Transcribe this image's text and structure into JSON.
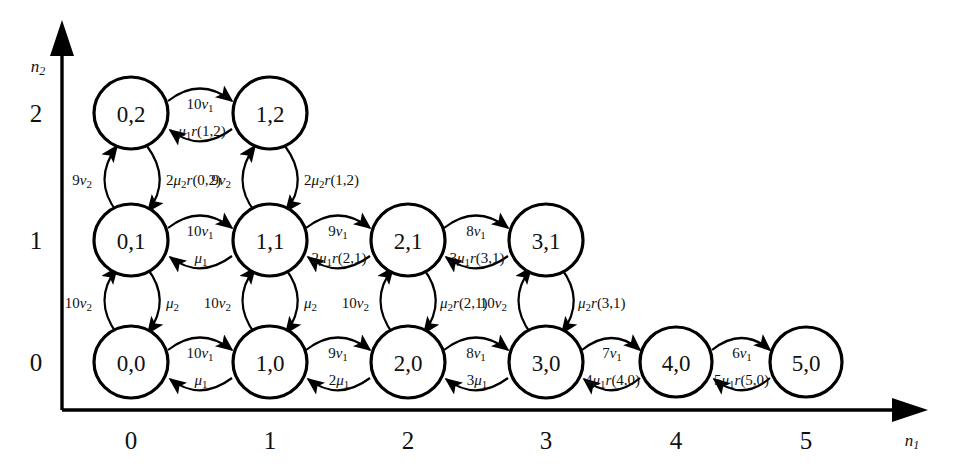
{
  "figure": {
    "type": "state-transition-diagram",
    "title": "",
    "axes": {
      "x": {
        "name": "n1",
        "name_sub": "1",
        "ticks": [
          "0",
          "1",
          "2",
          "3",
          "4",
          "5"
        ]
      },
      "y": {
        "name": "n2",
        "name_sub": "2",
        "ticks": [
          "0",
          "1",
          "2"
        ]
      }
    },
    "nodes": [
      {
        "id": "0,0",
        "label": "0,0",
        "x": 0,
        "y": 0
      },
      {
        "id": "1,0",
        "label": "1,0",
        "x": 1,
        "y": 0
      },
      {
        "id": "2,0",
        "label": "2,0",
        "x": 2,
        "y": 0
      },
      {
        "id": "3,0",
        "label": "3,0",
        "x": 3,
        "y": 0
      },
      {
        "id": "4,0",
        "label": "4,0",
        "x": 4,
        "y": 0
      },
      {
        "id": "5,0",
        "label": "5,0",
        "x": 5,
        "y": 0
      },
      {
        "id": "0,1",
        "label": "0,1",
        "x": 0,
        "y": 1
      },
      {
        "id": "1,1",
        "label": "1,1",
        "x": 1,
        "y": 1
      },
      {
        "id": "2,1",
        "label": "2,1",
        "x": 2,
        "y": 1
      },
      {
        "id": "3,1",
        "label": "3,1",
        "x": 3,
        "y": 1
      },
      {
        "id": "0,2",
        "label": "0,2",
        "x": 0,
        "y": 2
      },
      {
        "id": "1,2",
        "label": "1,2",
        "x": 1,
        "y": 2
      }
    ],
    "horizontal_transitions": [
      {
        "from": "0,0",
        "to": "1,0",
        "forward": "10v1",
        "backward": "μ1"
      },
      {
        "from": "1,0",
        "to": "2,0",
        "forward": "9v1",
        "backward": "2μ1"
      },
      {
        "from": "2,0",
        "to": "3,0",
        "forward": "8v1",
        "backward": "3μ1"
      },
      {
        "from": "3,0",
        "to": "4,0",
        "forward": "7v1",
        "backward": "4μ1r(4,0)"
      },
      {
        "from": "4,0",
        "to": "5,0",
        "forward": "6v1",
        "backward": "5μ1r(5,0)"
      },
      {
        "from": "0,1",
        "to": "1,1",
        "forward": "10v1",
        "backward": "μ1"
      },
      {
        "from": "1,1",
        "to": "2,1",
        "forward": "9v1",
        "backward": "2μ1r(2,1)"
      },
      {
        "from": "2,1",
        "to": "3,1",
        "forward": "8v1",
        "backward": "3μ1r(3,1)"
      },
      {
        "from": "0,2",
        "to": "1,2",
        "forward": "10v1",
        "backward": "μ1r(1,2)"
      }
    ],
    "vertical_transitions": [
      {
        "from": "0,0",
        "to": "0,1",
        "up": "10v2",
        "down": "μ2"
      },
      {
        "from": "1,0",
        "to": "1,1",
        "up": "10v2",
        "down": "μ2"
      },
      {
        "from": "2,0",
        "to": "2,1",
        "up": "10v2",
        "down": "μ2r(2,1)"
      },
      {
        "from": "3,0",
        "to": "3,1",
        "up": "10v2",
        "down": "μ2r(3,1)"
      },
      {
        "from": "0,1",
        "to": "0,2",
        "up": "9v2",
        "down": "2μ2r(0,2)"
      },
      {
        "from": "1,1",
        "to": "1,2",
        "up": "9v2",
        "down": "2μ2r(1,2)"
      }
    ],
    "rate_labels": {
      "h_forward": [
        {
          "base": "10",
          "sym": "v",
          "sub": "1"
        },
        {
          "base": "9",
          "sym": "v",
          "sub": "1"
        },
        {
          "base": "8",
          "sym": "v",
          "sub": "1"
        },
        {
          "base": "7",
          "sym": "v",
          "sub": "1"
        },
        {
          "base": "6",
          "sym": "v",
          "sub": "1"
        }
      ],
      "v_up": [
        {
          "base": "10",
          "sym": "v",
          "sub": "2"
        },
        {
          "base": "9",
          "sym": "v",
          "sub": "2"
        }
      ]
    },
    "colors": {
      "stroke": "#000000",
      "background": "#ffffff",
      "text": "#111111"
    }
  }
}
